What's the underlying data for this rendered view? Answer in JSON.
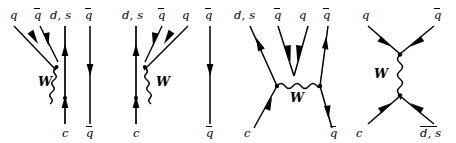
{
  "figure": {
    "width": 456,
    "height": 143,
    "line_color": "#000000",
    "background": "#ffffff"
  },
  "diagrams": [
    {
      "id": "external-w-emission-left",
      "name": "external-w-emission-left",
      "boson_label": "W",
      "top_labels": [
        {
          "text": "q",
          "bar": false
        },
        {
          "text": "q",
          "bar": true
        },
        {
          "text": "d, s",
          "bar": false
        },
        {
          "text": "q",
          "bar": true
        }
      ],
      "bottom_labels": [
        {
          "text": "c",
          "bar": false
        },
        {
          "text": "q",
          "bar": true
        }
      ]
    },
    {
      "id": "external-w-emission-right",
      "name": "external-w-emission-right",
      "boson_label": "W",
      "top_labels": [
        {
          "text": "d, s",
          "bar": false
        },
        {
          "text": "q",
          "bar": true
        },
        {
          "text": "q",
          "bar": false
        },
        {
          "text": "q",
          "bar": true
        }
      ],
      "bottom_labels": [
        {
          "text": "c",
          "bar": false
        },
        {
          "text": "q",
          "bar": true
        }
      ]
    },
    {
      "id": "w-exchange",
      "name": "w-exchange",
      "boson_label": "W",
      "top_labels": [
        {
          "text": "d, s",
          "bar": false
        },
        {
          "text": "q",
          "bar": true
        },
        {
          "text": "q",
          "bar": false
        },
        {
          "text": "q",
          "bar": true
        }
      ],
      "bottom_labels": [
        {
          "text": "c",
          "bar": false
        },
        {
          "text": "q",
          "bar": true
        }
      ]
    },
    {
      "id": "w-annihilation",
      "name": "w-annihilation",
      "boson_label": "W",
      "top_labels": [
        {
          "text": "q",
          "bar": false
        },
        {
          "text": "q",
          "bar": true
        }
      ],
      "bottom_labels": [
        {
          "text": "c",
          "bar": false
        },
        {
          "text": "d, s",
          "bar": true,
          "bar_each": true
        }
      ]
    }
  ]
}
